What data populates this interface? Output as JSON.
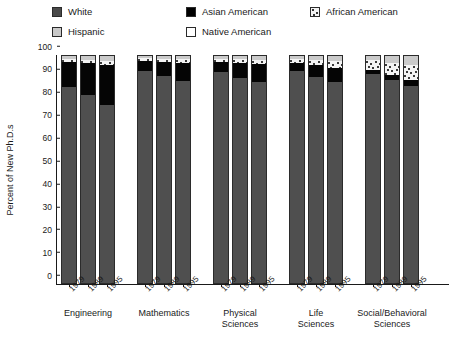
{
  "chart_data": {
    "type": "bar",
    "subtype": "stacked-bar-grouped",
    "title": "",
    "xlabel": "",
    "ylabel": "Percent of New Ph.D.s",
    "ylim": [
      0,
      100
    ],
    "yticks": [
      0,
      10,
      20,
      30,
      40,
      50,
      60,
      70,
      80,
      90,
      100
    ],
    "grid": false,
    "legend_position": "top",
    "stack_order_bottom_to_top": [
      "White",
      "Asian American",
      "African American",
      "Hispanic",
      "Native American"
    ],
    "series": [
      {
        "name": "White",
        "color": "#4f4f4f"
      },
      {
        "name": "Asian American",
        "color": "#050505"
      },
      {
        "name": "African American",
        "color": "#f4f4f4"
      },
      {
        "name": "Hispanic",
        "color": "#cacaca"
      },
      {
        "name": "Native American",
        "color": "#ffffff"
      }
    ],
    "groups": [
      {
        "label": "Engineering",
        "years": [
          "1979",
          "1989",
          "1995"
        ],
        "bars": [
          {
            "year": "1979",
            "White": 86.0,
            "Asian American": 11.0,
            "African American": 1.4,
            "Hispanic": 1.3,
            "Native American": 0.3
          },
          {
            "year": "1989",
            "White": 82.5,
            "Asian American": 14.0,
            "African American": 1.5,
            "Hispanic": 1.7,
            "Native American": 0.3
          },
          {
            "year": "1995",
            "White": 78.0,
            "Asian American": 17.5,
            "African American": 2.0,
            "Hispanic": 2.2,
            "Native American": 0.3
          }
        ]
      },
      {
        "label": "Mathematics",
        "years": [
          "1979",
          "1989",
          "1995"
        ],
        "bars": [
          {
            "year": "1979",
            "White": 93.0,
            "Asian American": 4.5,
            "African American": 1.2,
            "Hispanic": 1.0,
            "Native American": 0.3
          },
          {
            "year": "1989",
            "White": 91.0,
            "Asian American": 6.0,
            "African American": 1.4,
            "Hispanic": 1.3,
            "Native American": 0.3
          },
          {
            "year": "1995",
            "White": 88.5,
            "Asian American": 8.0,
            "African American": 1.6,
            "Hispanic": 1.6,
            "Native American": 0.3
          }
        ]
      },
      {
        "label": "Physical\nSciences",
        "years": [
          "1979",
          "1989",
          "1995"
        ],
        "bars": [
          {
            "year": "1979",
            "White": 92.5,
            "Asian American": 4.5,
            "African American": 1.4,
            "Hispanic": 1.3,
            "Native American": 0.3
          },
          {
            "year": "1989",
            "White": 90.0,
            "Asian American": 6.5,
            "African American": 1.6,
            "Hispanic": 1.6,
            "Native American": 0.3
          },
          {
            "year": "1995",
            "White": 88.0,
            "Asian American": 8.0,
            "African American": 1.9,
            "Hispanic": 1.8,
            "Native American": 0.3
          }
        ]
      },
      {
        "label": "Life\nSciences",
        "years": [
          "1979",
          "1989",
          "1995"
        ],
        "bars": [
          {
            "year": "1979",
            "White": 93.0,
            "Asian American": 3.5,
            "African American": 1.8,
            "Hispanic": 1.4,
            "Native American": 0.3
          },
          {
            "year": "1989",
            "White": 90.5,
            "Asian American": 5.0,
            "African American": 2.2,
            "Hispanic": 2.0,
            "Native American": 0.3
          },
          {
            "year": "1995",
            "White": 88.0,
            "Asian American": 6.5,
            "African American": 2.8,
            "Hispanic": 2.4,
            "Native American": 0.3
          }
        ]
      },
      {
        "label": "Social/Behavioral\nSciences",
        "years": [
          "1979",
          "1989",
          "1995"
        ],
        "bars": [
          {
            "year": "1979",
            "White": 91.5,
            "Asian American": 1.8,
            "African American": 4.4,
            "Hispanic": 2.0,
            "Native American": 0.3
          },
          {
            "year": "1989",
            "White": 89.0,
            "Asian American": 2.2,
            "African American": 5.5,
            "Hispanic": 3.0,
            "Native American": 0.3
          },
          {
            "year": "1995",
            "White": 86.5,
            "Asian American": 2.8,
            "African American": 6.4,
            "Hispanic": 4.0,
            "Native American": 0.3
          }
        ]
      }
    ]
  },
  "legend": {
    "items": [
      {
        "label": "White",
        "swatch": "sw-white"
      },
      {
        "label": "Hispanic",
        "swatch": "sw-hispanic"
      },
      {
        "label": "Asian American",
        "swatch": "sw-asian"
      },
      {
        "label": "Native American",
        "swatch": "sw-native"
      },
      {
        "label": "African American",
        "swatch": "sw-african"
      }
    ]
  },
  "axes": {
    "y_title": "Percent of New Ph.D.s"
  }
}
